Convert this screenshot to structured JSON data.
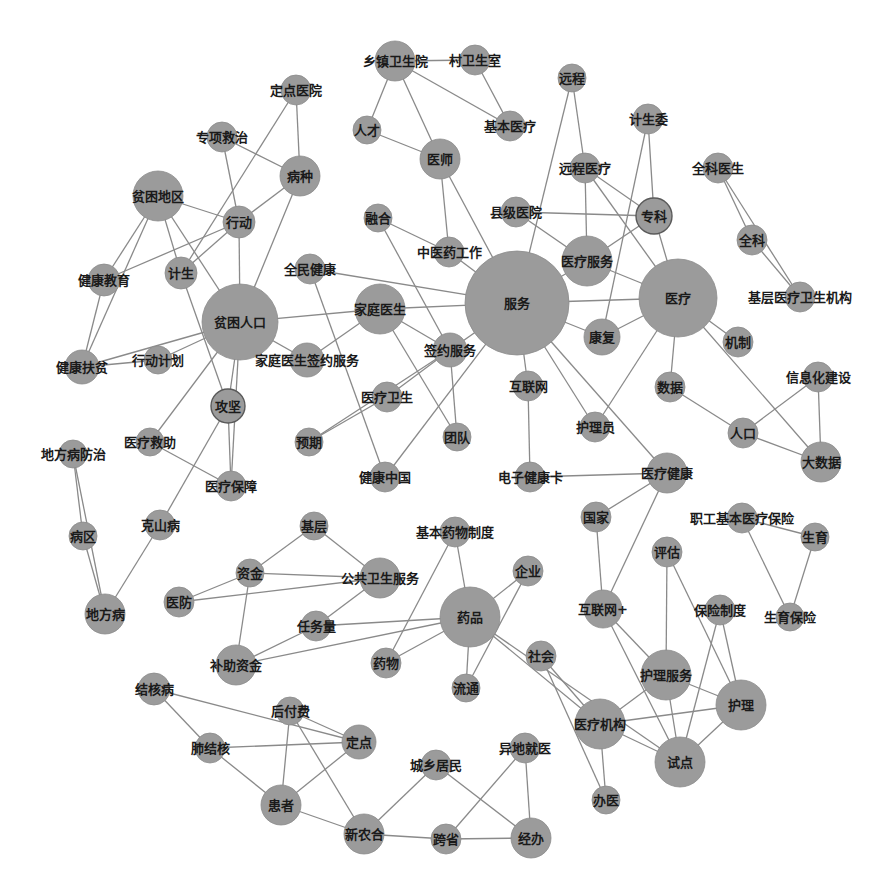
{
  "diagram": {
    "type": "network",
    "colors": {
      "node": "#9b9b9b",
      "edge": "#8a8a8a",
      "label": "#1a1a1a",
      "background": "#ffffff"
    },
    "nodes": [
      {
        "id": "服务",
        "x": 517,
        "y": 303,
        "r": 52
      },
      {
        "id": "医疗",
        "x": 678,
        "y": 298,
        "r": 39
      },
      {
        "id": "贫困人口",
        "x": 240,
        "y": 322,
        "r": 38
      },
      {
        "id": "药品",
        "x": 470,
        "y": 617,
        "r": 30
      },
      {
        "id": "贫困地区",
        "x": 158,
        "y": 196,
        "r": 25
      },
      {
        "id": "家庭医生",
        "x": 380,
        "y": 309,
        "r": 25
      },
      {
        "id": "医疗服务",
        "x": 587,
        "y": 261,
        "r": 25
      },
      {
        "id": "护理服务",
        "x": 666,
        "y": 675,
        "r": 25
      },
      {
        "id": "医疗机构",
        "x": 600,
        "y": 724,
        "r": 25
      },
      {
        "id": "试点",
        "x": 680,
        "y": 762,
        "r": 25
      },
      {
        "id": "护理",
        "x": 741,
        "y": 705,
        "r": 25
      },
      {
        "id": "公共卫生服务",
        "x": 380,
        "y": 578,
        "r": 20
      },
      {
        "id": "补助资金",
        "x": 236,
        "y": 665,
        "r": 20
      },
      {
        "id": "新农合",
        "x": 364,
        "y": 834,
        "r": 20
      },
      {
        "id": "经办",
        "x": 531,
        "y": 838,
        "r": 20
      },
      {
        "id": "患者",
        "x": 281,
        "y": 805,
        "r": 20
      },
      {
        "id": "地方病",
        "x": 105,
        "y": 614,
        "r": 20
      },
      {
        "id": "大数据",
        "x": 821,
        "y": 462,
        "r": 20
      },
      {
        "id": "乡镇卫生院",
        "x": 395,
        "y": 61,
        "r": 20
      },
      {
        "id": "医师",
        "x": 440,
        "y": 159,
        "r": 20
      },
      {
        "id": "病种",
        "x": 300,
        "y": 176,
        "r": 20
      },
      {
        "id": "专科",
        "x": 654,
        "y": 216,
        "r": 18,
        "ringed": true
      },
      {
        "id": "医疗健康",
        "x": 667,
        "y": 473,
        "r": 20
      },
      {
        "id": "签约服务",
        "x": 450,
        "y": 350,
        "r": 17
      },
      {
        "id": "攻坚",
        "x": 228,
        "y": 406,
        "r": 17,
        "ringed": true
      },
      {
        "id": "行动",
        "x": 239,
        "y": 222,
        "r": 16
      },
      {
        "id": "计生",
        "x": 181,
        "y": 273,
        "r": 16
      },
      {
        "id": "健康教育",
        "x": 104,
        "y": 280,
        "r": 16
      },
      {
        "id": "健康扶贫",
        "x": 82,
        "y": 367,
        "r": 17
      },
      {
        "id": "行动计划",
        "x": 158,
        "y": 360,
        "r": 14
      },
      {
        "id": "家庭医生签约服务",
        "x": 307,
        "y": 360,
        "r": 17
      },
      {
        "id": "定点医院",
        "x": 296,
        "y": 90,
        "r": 15
      },
      {
        "id": "专项救治",
        "x": 222,
        "y": 137,
        "r": 15
      },
      {
        "id": "人才",
        "x": 367,
        "y": 130,
        "r": 14
      },
      {
        "id": "村卫生室",
        "x": 475,
        "y": 60,
        "r": 15
      },
      {
        "id": "基本医疗",
        "x": 510,
        "y": 126,
        "r": 15
      },
      {
        "id": "远程",
        "x": 572,
        "y": 78,
        "r": 14
      },
      {
        "id": "计生委",
        "x": 648,
        "y": 119,
        "r": 15
      },
      {
        "id": "远程医疗",
        "x": 585,
        "y": 168,
        "r": 15
      },
      {
        "id": "全科医生",
        "x": 718,
        "y": 168,
        "r": 15
      },
      {
        "id": "全科",
        "x": 752,
        "y": 240,
        "r": 15
      },
      {
        "id": "基层医疗卫生机构",
        "x": 800,
        "y": 297,
        "r": 15
      },
      {
        "id": "县级医院",
        "x": 516,
        "y": 212,
        "r": 15
      },
      {
        "id": "融合",
        "x": 378,
        "y": 218,
        "r": 14
      },
      {
        "id": "中医药工作",
        "x": 449,
        "y": 252,
        "r": 15
      },
      {
        "id": "全民健康",
        "x": 310,
        "y": 269,
        "r": 15
      },
      {
        "id": "康复",
        "x": 602,
        "y": 337,
        "r": 18
      },
      {
        "id": "机制",
        "x": 738,
        "y": 342,
        "r": 15
      },
      {
        "id": "数据",
        "x": 670,
        "y": 387,
        "r": 15
      },
      {
        "id": "信息化建设",
        "x": 818,
        "y": 377,
        "r": 15
      },
      {
        "id": "人口",
        "x": 743,
        "y": 433,
        "r": 15
      },
      {
        "id": "互联网",
        "x": 528,
        "y": 386,
        "r": 15
      },
      {
        "id": "护理员",
        "x": 595,
        "y": 427,
        "r": 15
      },
      {
        "id": "医疗卫生",
        "x": 387,
        "y": 397,
        "r": 15
      },
      {
        "id": "预期",
        "x": 309,
        "y": 442,
        "r": 14
      },
      {
        "id": "团队",
        "x": 457,
        "y": 437,
        "r": 14
      },
      {
        "id": "健康中国",
        "x": 385,
        "y": 477,
        "r": 15
      },
      {
        "id": "电子健康卡",
        "x": 530,
        "y": 477,
        "r": 15
      },
      {
        "id": "医疗救助",
        "x": 150,
        "y": 442,
        "r": 14
      },
      {
        "id": "医疗保障",
        "x": 231,
        "y": 486,
        "r": 15
      },
      {
        "id": "地方病防治",
        "x": 73,
        "y": 454,
        "r": 14
      },
      {
        "id": "病区",
        "x": 83,
        "y": 536,
        "r": 14
      },
      {
        "id": "克山病",
        "x": 160,
        "y": 525,
        "r": 15
      },
      {
        "id": "基层",
        "x": 314,
        "y": 526,
        "r": 14
      },
      {
        "id": "资金",
        "x": 250,
        "y": 573,
        "r": 14
      },
      {
        "id": "医防",
        "x": 179,
        "y": 602,
        "r": 15
      },
      {
        "id": "任务量",
        "x": 316,
        "y": 626,
        "r": 15
      },
      {
        "id": "基本药物制度",
        "x": 455,
        "y": 532,
        "r": 15
      },
      {
        "id": "企业",
        "x": 528,
        "y": 571,
        "r": 15
      },
      {
        "id": "药物",
        "x": 386,
        "y": 663,
        "r": 15
      },
      {
        "id": "流通",
        "x": 466,
        "y": 688,
        "r": 14
      },
      {
        "id": "社会",
        "x": 541,
        "y": 656,
        "r": 15
      },
      {
        "id": "国家",
        "x": 596,
        "y": 517,
        "r": 15
      },
      {
        "id": "职工基本医疗保险",
        "x": 742,
        "y": 518,
        "r": 15
      },
      {
        "id": "生育",
        "x": 815,
        "y": 537,
        "r": 14
      },
      {
        "id": "评估",
        "x": 667,
        "y": 552,
        "r": 15
      },
      {
        "id": "互联网+",
        "x": 603,
        "y": 609,
        "r": 19
      },
      {
        "id": "保险制度",
        "x": 720,
        "y": 610,
        "r": 15
      },
      {
        "id": "生育保险",
        "x": 790,
        "y": 617,
        "r": 14
      },
      {
        "id": "办医",
        "x": 606,
        "y": 800,
        "r": 14
      },
      {
        "id": "结核病",
        "x": 154,
        "y": 689,
        "r": 16
      },
      {
        "id": "后付费",
        "x": 290,
        "y": 711,
        "r": 14
      },
      {
        "id": "定点",
        "x": 359,
        "y": 742,
        "r": 17
      },
      {
        "id": "肺结核",
        "x": 210,
        "y": 748,
        "r": 15
      },
      {
        "id": "城乡居民",
        "x": 436,
        "y": 765,
        "r": 15
      },
      {
        "id": "异地就医",
        "x": 525,
        "y": 748,
        "r": 15
      },
      {
        "id": "跨省",
        "x": 446,
        "y": 839,
        "r": 15
      }
    ],
    "edges": [
      [
        "乡镇卫生院",
        "村卫生室"
      ],
      [
        "乡镇卫生院",
        "人才"
      ],
      [
        "乡镇卫生院",
        "医师"
      ],
      [
        "乡镇卫生院",
        "基本医疗"
      ],
      [
        "村卫生室",
        "基本医疗"
      ],
      [
        "人才",
        "医师"
      ],
      [
        "医师",
        "中医药工作"
      ],
      [
        "医师",
        "服务"
      ],
      [
        "定点医院",
        "病种"
      ],
      [
        "定点医院",
        "计生"
      ],
      [
        "专项救治",
        "病种"
      ],
      [
        "专项救治",
        "行动"
      ],
      [
        "病种",
        "行动"
      ],
      [
        "病种",
        "贫困人口"
      ],
      [
        "贫困地区",
        "行动"
      ],
      [
        "贫困地区",
        "健康教育"
      ],
      [
        "贫困地区",
        "健康扶贫"
      ],
      [
        "贫困地区",
        "计生"
      ],
      [
        "贫困地区",
        "贫困人口"
      ],
      [
        "行动",
        "健康教育"
      ],
      [
        "行动",
        "贫困人口"
      ],
      [
        "行动",
        "计生"
      ],
      [
        "健康教育",
        "健康扶贫"
      ],
      [
        "计生",
        "攻坚"
      ],
      [
        "健康扶贫",
        "贫困人口"
      ],
      [
        "健康扶贫",
        "行动计划"
      ],
      [
        "行动计划",
        "贫困人口"
      ],
      [
        "贫困人口",
        "家庭医生"
      ],
      [
        "贫困人口",
        "家庭医生签约服务"
      ],
      [
        "贫困人口",
        "攻坚"
      ],
      [
        "贫困人口",
        "医疗救助"
      ],
      [
        "贫困人口",
        "医疗保障"
      ],
      [
        "攻坚",
        "克山病"
      ],
      [
        "攻坚",
        "医疗保障"
      ],
      [
        "医疗救助",
        "医疗保障"
      ],
      [
        "家庭医生签约服务",
        "家庭医生"
      ],
      [
        "家庭医生",
        "服务"
      ],
      [
        "家庭医生",
        "签约服务"
      ],
      [
        "家庭医生",
        "团队"
      ],
      [
        "全民健康",
        "服务"
      ],
      [
        "全民健康",
        "健康中国"
      ],
      [
        "融合",
        "中医药工作"
      ],
      [
        "融合",
        "签约服务"
      ],
      [
        "中医药工作",
        "服务"
      ],
      [
        "签约服务",
        "服务"
      ],
      [
        "签约服务",
        "医疗卫生"
      ],
      [
        "签约服务",
        "预期"
      ],
      [
        "签约服务",
        "团队"
      ],
      [
        "医疗卫生",
        "预期"
      ],
      [
        "健康中国",
        "服务"
      ],
      [
        "远程",
        "远程医疗"
      ],
      [
        "远程",
        "服务"
      ],
      [
        "远程医疗",
        "医疗服务"
      ],
      [
        "远程医疗",
        "专科"
      ],
      [
        "远程医疗",
        "医疗"
      ],
      [
        "计生委",
        "专科"
      ],
      [
        "计生委",
        "康复"
      ],
      [
        "县级医院",
        "专科"
      ],
      [
        "县级医院",
        "医疗服务"
      ],
      [
        "专科",
        "医疗服务"
      ],
      [
        "专科",
        "医疗"
      ],
      [
        "医疗服务",
        "服务"
      ],
      [
        "医疗服务",
        "医疗"
      ],
      [
        "服务",
        "医疗"
      ],
      [
        "服务",
        "康复"
      ],
      [
        "服务",
        "互联网"
      ],
      [
        "服务",
        "护理员"
      ],
      [
        "服务",
        "医疗健康"
      ],
      [
        "医疗",
        "康复"
      ],
      [
        "医疗",
        "机制"
      ],
      [
        "医疗",
        "数据"
      ],
      [
        "医疗",
        "护理员"
      ],
      [
        "医疗",
        "大数据"
      ],
      [
        "全科医生",
        "全科"
      ],
      [
        "全科医生",
        "基层医疗卫生机构"
      ],
      [
        "全科",
        "基层医疗卫生机构"
      ],
      [
        "数据",
        "人口"
      ],
      [
        "人口",
        "信息化建设"
      ],
      [
        "人口",
        "大数据"
      ],
      [
        "信息化建设",
        "大数据"
      ],
      [
        "互联网",
        "电子健康卡"
      ],
      [
        "电子健康卡",
        "医疗健康"
      ],
      [
        "医疗健康",
        "国家"
      ],
      [
        "医疗健康",
        "互联网+"
      ],
      [
        "国家",
        "互联网+"
      ],
      [
        "职工基本医疗保险",
        "生育"
      ],
      [
        "职工基本医疗保险",
        "生育保险"
      ],
      [
        "生育",
        "生育保险"
      ],
      [
        "评估",
        "护理服务"
      ],
      [
        "评估",
        "护理"
      ],
      [
        "互联网+",
        "护理服务"
      ],
      [
        "互联网+",
        "试点"
      ],
      [
        "保险制度",
        "护理"
      ],
      [
        "保险制度",
        "试点"
      ],
      [
        "护理服务",
        "医疗机构"
      ],
      [
        "护理服务",
        "护理"
      ],
      [
        "护理服务",
        "试点"
      ],
      [
        "护理",
        "医疗机构"
      ],
      [
        "护理",
        "试点"
      ],
      [
        "医疗机构",
        "试点"
      ],
      [
        "医疗机构",
        "社会"
      ],
      [
        "医疗机构",
        "办医"
      ],
      [
        "医疗机构",
        "药品"
      ],
      [
        "社会",
        "办医"
      ],
      [
        "地方病防治",
        "病区"
      ],
      [
        "地方病防治",
        "地方病"
      ],
      [
        "病区",
        "地方病"
      ],
      [
        "克山病",
        "地方病"
      ],
      [
        "基层",
        "资金"
      ],
      [
        "基层",
        "公共卫生服务"
      ],
      [
        "资金",
        "公共卫生服务"
      ],
      [
        "资金",
        "医防"
      ],
      [
        "资金",
        "补助资金"
      ],
      [
        "医防",
        "公共卫生服务"
      ],
      [
        "公共卫生服务",
        "任务量"
      ],
      [
        "任务量",
        "补助资金"
      ],
      [
        "任务量",
        "药品"
      ],
      [
        "补助资金",
        "药品"
      ],
      [
        "基本药物制度",
        "药品"
      ],
      [
        "基本药物制度",
        "药物"
      ],
      [
        "药品",
        "企业"
      ],
      [
        "药品",
        "药物"
      ],
      [
        "药品",
        "流通"
      ],
      [
        "药品",
        "试点"
      ],
      [
        "企业",
        "流通"
      ],
      [
        "结核病",
        "肺结核"
      ],
      [
        "结核病",
        "定点"
      ],
      [
        "后付费",
        "患者"
      ],
      [
        "后付费",
        "新农合"
      ],
      [
        "后付费",
        "定点"
      ],
      [
        "定点",
        "肺结核"
      ],
      [
        "定点",
        "患者"
      ],
      [
        "肺结核",
        "患者"
      ],
      [
        "患者",
        "新农合"
      ],
      [
        "新农合",
        "城乡居民"
      ],
      [
        "新农合",
        "跨省"
      ],
      [
        "城乡居民",
        "经办"
      ],
      [
        "异地就医",
        "跨省"
      ],
      [
        "异地就医",
        "经办"
      ],
      [
        "跨省",
        "经办"
      ]
    ]
  }
}
